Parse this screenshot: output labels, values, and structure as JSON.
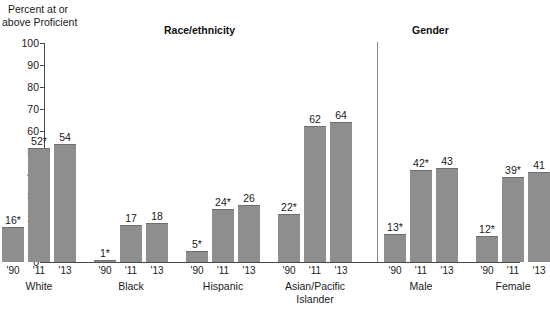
{
  "chart_data": {
    "type": "bar",
    "title": "",
    "ylabel": "Percent at or above Proficient",
    "xlabel": "",
    "ylim": [
      0,
      100
    ],
    "ytick_step": 10,
    "grid": false,
    "legend": "none",
    "bar_color": "#8e8e8e",
    "axis_color": "#4a4a4a",
    "yticks": [
      "100",
      "90",
      "80",
      "70",
      "60",
      "50",
      "40",
      "30",
      "20",
      "10",
      "0"
    ],
    "ylabel_line1": "Percent at or",
    "ylabel_line2": "above Proficient",
    "sections": [
      {
        "name": "race",
        "label": "Race/ethnicity"
      },
      {
        "name": "gender",
        "label": "Gender"
      }
    ],
    "categories": [
      "'90",
      "'11",
      "'13"
    ],
    "groups": [
      {
        "label": "White",
        "label_line1": "White",
        "label_line2": "",
        "section": "race",
        "bars": [
          {
            "x": "'90",
            "value": 16,
            "label": "16*",
            "significant": true
          },
          {
            "x": "'11",
            "value": 52,
            "label": "52*",
            "significant": true
          },
          {
            "x": "'13",
            "value": 54,
            "label": "54",
            "significant": false
          }
        ]
      },
      {
        "label": "Black",
        "label_line1": "Black",
        "label_line2": "",
        "section": "race",
        "bars": [
          {
            "x": "'90",
            "value": 1,
            "label": "1*",
            "significant": true
          },
          {
            "x": "'11",
            "value": 17,
            "label": "17",
            "significant": false
          },
          {
            "x": "'13",
            "value": 18,
            "label": "18",
            "significant": false
          }
        ]
      },
      {
        "label": "Hispanic",
        "label_line1": "Hispanic",
        "label_line2": "",
        "section": "race",
        "bars": [
          {
            "x": "'90",
            "value": 5,
            "label": "5*",
            "significant": true
          },
          {
            "x": "'11",
            "value": 24,
            "label": "24*",
            "significant": true
          },
          {
            "x": "'13",
            "value": 26,
            "label": "26",
            "significant": false
          }
        ]
      },
      {
        "label": "Asian/Pacific Islander",
        "label_line1": "Asian/Pacific",
        "label_line2": "Islander",
        "section": "race",
        "bars": [
          {
            "x": "'90",
            "value": 22,
            "label": "22*",
            "significant": true
          },
          {
            "x": "'11",
            "value": 62,
            "label": "62",
            "significant": false
          },
          {
            "x": "'13",
            "value": 64,
            "label": "64",
            "significant": false
          }
        ]
      },
      {
        "label": "Male",
        "label_line1": "Male",
        "label_line2": "",
        "section": "gender",
        "bars": [
          {
            "x": "'90",
            "value": 13,
            "label": "13*",
            "significant": true
          },
          {
            "x": "'11",
            "value": 42,
            "label": "42*",
            "significant": true
          },
          {
            "x": "'13",
            "value": 43,
            "label": "43",
            "significant": false
          }
        ]
      },
      {
        "label": "Female",
        "label_line1": "Female",
        "label_line2": "",
        "section": "gender",
        "bars": [
          {
            "x": "'90",
            "value": 12,
            "label": "12*",
            "significant": true
          },
          {
            "x": "'11",
            "value": 39,
            "label": "39*",
            "significant": true
          },
          {
            "x": "'13",
            "value": 41,
            "label": "41",
            "significant": false
          }
        ]
      }
    ]
  }
}
